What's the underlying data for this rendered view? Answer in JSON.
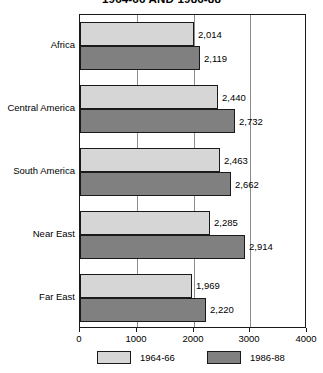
{
  "chart_data": {
    "type": "bar",
    "orientation": "horizontal",
    "title": "1964-66 AND 1986-88",
    "xlabel": "",
    "ylabel": "",
    "xlim": [
      0,
      4000
    ],
    "xticks": [
      0,
      1000,
      2000,
      3000,
      4000
    ],
    "xtick_labels": [
      "0",
      "1000",
      "2000",
      "3000",
      "4000"
    ],
    "grid": true,
    "grid_axis": "x",
    "legend_position": "bottom",
    "categories": [
      "Africa",
      "Central America",
      "South America",
      "Near East",
      "Far East"
    ],
    "series": [
      {
        "name": "1964-66",
        "color": "#d6d6d6",
        "values": [
          2014,
          2440,
          2463,
          2285,
          1969
        ],
        "value_labels": [
          "2,014",
          "2,440",
          "2,463",
          "2,285",
          "1,969"
        ]
      },
      {
        "name": "1986-88",
        "color": "#808080",
        "values": [
          2119,
          2732,
          2662,
          2914,
          2220
        ],
        "value_labels": [
          "2,119",
          "2,732",
          "2,662",
          "2,914",
          "2,220"
        ]
      }
    ]
  },
  "colors": {
    "series_1964_66": "#d6d6d6",
    "series_1986_88": "#808080",
    "axis": "#1a1a1a",
    "gridline": "#8c8c8c",
    "background": "#ffffff"
  }
}
